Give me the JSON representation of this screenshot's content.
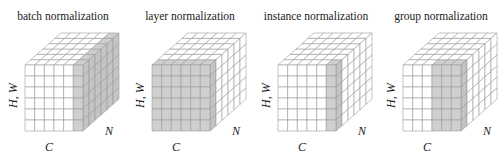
{
  "figure": {
    "panels": [
      {
        "id": "batch",
        "title": "batch normalization",
        "shading": "batch"
      },
      {
        "id": "layer",
        "title": "layer normalization",
        "shading": "layer"
      },
      {
        "id": "instance",
        "title": "instance normalization",
        "shading": "instance"
      },
      {
        "id": "group",
        "title": "group normalization",
        "shading": "group"
      }
    ],
    "axis_labels": {
      "hw": "H, W",
      "c": "C",
      "n": "N"
    },
    "grid": {
      "channels": 6,
      "spatial": 6,
      "batch": 6
    },
    "colors": {
      "fill": "#ffffff",
      "shade": "#cfcfcf",
      "shade_side": "#c4c4c4",
      "line": "#9a9a9a"
    }
  }
}
